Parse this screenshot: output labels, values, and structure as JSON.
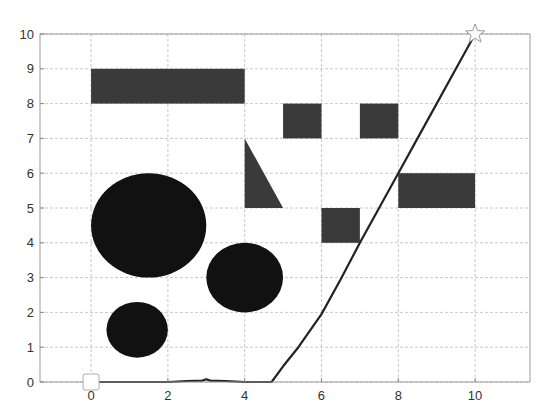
{
  "chart_data": {
    "type": "line",
    "title": "",
    "xlabel": "",
    "ylabel": "",
    "xlim": [
      -1.33,
      11.43
    ],
    "ylim": [
      0,
      10
    ],
    "grid": true,
    "legend": null,
    "x_ticks": [
      0,
      2,
      4,
      6,
      8,
      10
    ],
    "x_tick_labels": [
      "0",
      "2",
      "4",
      "6",
      "8",
      "10"
    ],
    "y_ticks": [
      0,
      1,
      2,
      3,
      4,
      5,
      6,
      7,
      8,
      9,
      10
    ],
    "y_tick_labels": [
      "0",
      "1",
      "2",
      "3",
      "4",
      "5",
      "6",
      "7",
      "8",
      "9",
      "10"
    ],
    "series": [
      {
        "name": "path",
        "color": "#222222",
        "x": [
          0,
          1,
          2,
          2.5,
          2.9,
          3.0,
          3.1,
          3.5,
          4.0,
          4.5,
          4.7,
          5.0,
          5.4,
          6.0,
          6.5,
          7.0,
          7.5,
          8.0,
          8.5,
          9.0,
          9.5,
          10.0
        ],
        "y": [
          0,
          0,
          0,
          0.03,
          0.04,
          0.08,
          0.04,
          0.03,
          0,
          0,
          0,
          0.45,
          1.0,
          1.95,
          2.95,
          4.0,
          5.0,
          6.0,
          7.0,
          8.0,
          9.0,
          10.0
        ]
      }
    ],
    "markers": {
      "start": {
        "shape": "square",
        "x": 0,
        "y": 0,
        "fill": "#ffffff",
        "stroke": "#aaaaaa"
      },
      "goal": {
        "shape": "star",
        "x": 10,
        "y": 10,
        "fill": "#ffffff",
        "stroke": "#999999"
      }
    },
    "obstacles": {
      "rect_color": "#3a3a3a",
      "circle_color": "#111111",
      "rectangles": [
        {
          "x0": 0,
          "x1": 4,
          "y0": 8,
          "y1": 9
        },
        {
          "x0": 5,
          "x1": 6,
          "y0": 7,
          "y1": 8
        },
        {
          "x0": 7,
          "x1": 8,
          "y0": 7,
          "y1": 8
        },
        {
          "x0": 6,
          "x1": 7,
          "y0": 4,
          "y1": 5
        },
        {
          "x0": 8,
          "x1": 10,
          "y0": 5,
          "y1": 6
        }
      ],
      "triangles": [
        {
          "points": [
            [
              4,
              7
            ],
            [
              4,
              5
            ],
            [
              5,
              5
            ]
          ]
        }
      ],
      "circles": [
        {
          "cx": 1.5,
          "cy": 4.5,
          "r": 1.5
        },
        {
          "cx": 4.0,
          "cy": 3.0,
          "r": 1.0
        },
        {
          "cx": 1.2,
          "cy": 1.5,
          "r": 0.8
        }
      ]
    }
  }
}
